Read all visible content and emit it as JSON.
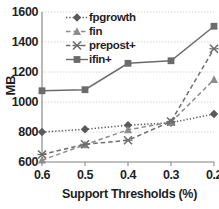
{
  "chart_data": {
    "type": "line",
    "title": "",
    "xlabel": "Support Thresholds (%)",
    "ylabel": "MB",
    "categories": [
      "0.6",
      "0.5",
      "0.4",
      "0.3",
      "0.2"
    ],
    "x_tick_labels": [
      "0.6",
      "0.5",
      "0.4",
      "0.3",
      "0.2"
    ],
    "y_tick_labels": [
      "600",
      "800",
      "1000",
      "1200",
      "1400",
      "1600"
    ],
    "y_ticks": [
      600,
      800,
      1000,
      1200,
      1400,
      1600
    ],
    "ylim": [
      600,
      1600
    ],
    "grid": true,
    "grid_axis": "y",
    "legend_position": "top-left-inside",
    "series": [
      {
        "name": "fpgrowth",
        "marker": "diamond",
        "linestyle": "dotted",
        "color": "#595959",
        "values": [
          800,
          818,
          845,
          862,
          920
        ]
      },
      {
        "name": "fin",
        "marker": "triangle",
        "linestyle": "dashed",
        "color": "#8c8c8c",
        "values": [
          612,
          715,
          815,
          865,
          1150
        ]
      },
      {
        "name": "prepost+",
        "marker": "x",
        "linestyle": "dashed",
        "color": "#6e6e6e",
        "values": [
          650,
          718,
          745,
          870,
          1355
        ]
      },
      {
        "name": "ifin+",
        "marker": "square",
        "linestyle": "solid",
        "color": "#6b6b6b",
        "values": [
          1075,
          1082,
          1258,
          1275,
          1505
        ]
      }
    ]
  },
  "legend": {
    "items": [
      {
        "label": "fpgrowth"
      },
      {
        "label": "fin"
      },
      {
        "label": "prepost+"
      },
      {
        "label": "ifin+"
      }
    ]
  },
  "axes": {
    "y_title": "MB",
    "x_title": "Support Thresholds (%)"
  }
}
